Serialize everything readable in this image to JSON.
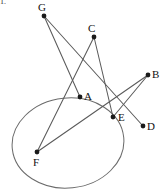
{
  "figure": {
    "corner_mark": "1.",
    "width": 161,
    "height": 189,
    "background_color": "#ffffff",
    "line_color": "#5a5a5a",
    "curve_color": "#6b6b6b",
    "point_color": "#1a1a1a",
    "label_color": "#111111",
    "points": [
      {
        "id": "G",
        "label": "G",
        "x": 44,
        "y": 16,
        "label_x": 38,
        "label_y": 2
      },
      {
        "id": "C",
        "label": "C",
        "x": 94,
        "y": 37,
        "label_x": 88,
        "label_y": 23
      },
      {
        "id": "B",
        "label": "B",
        "x": 148,
        "y": 75,
        "label_x": 152,
        "label_y": 69
      },
      {
        "id": "A",
        "label": "A",
        "x": 80,
        "y": 97,
        "label_x": 84,
        "label_y": 91
      },
      {
        "id": "E",
        "label": "E",
        "x": 113,
        "y": 117,
        "label_x": 118,
        "label_y": 112
      },
      {
        "id": "D",
        "label": "D",
        "x": 143,
        "y": 126,
        "label_x": 147,
        "label_y": 121
      },
      {
        "id": "F",
        "label": "F",
        "x": 37,
        "y": 152,
        "label_x": 33,
        "label_y": 157
      }
    ],
    "segments": [
      {
        "id": "GA",
        "from": "G",
        "to": "A"
      },
      {
        "id": "GD",
        "from": "G",
        "to": "D"
      },
      {
        "id": "CF",
        "from": "C",
        "to": "F"
      },
      {
        "id": "CE",
        "from": "C",
        "to": "E"
      },
      {
        "id": "FB",
        "from": "F",
        "to": "B"
      },
      {
        "id": "EB",
        "from": "E",
        "to": "B"
      }
    ],
    "ellipse": {
      "id": "circle-oval",
      "cx": 68,
      "cy": 143,
      "rx": 56,
      "ry": 45,
      "rotation": -6
    }
  }
}
